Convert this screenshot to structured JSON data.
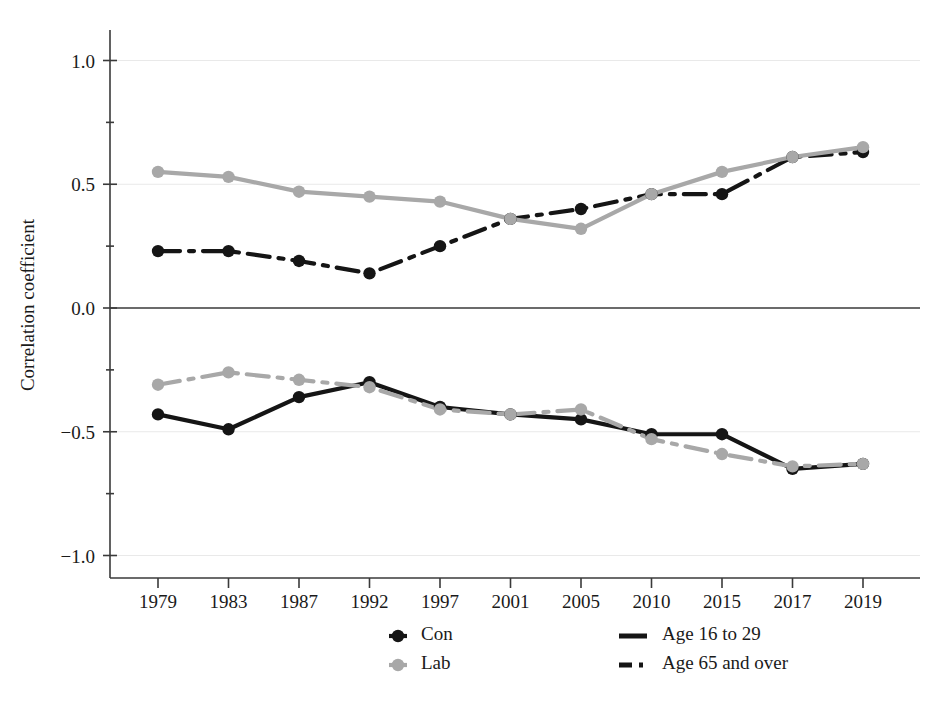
{
  "chart_data": {
    "type": "line",
    "title": "",
    "subtitle": "",
    "xlabel": "",
    "ylabel": "Correlation coefficient",
    "categories": [
      "1979",
      "1983",
      "1987",
      "1992",
      "1997",
      "2001",
      "2005",
      "2010",
      "2015",
      "2017",
      "2019"
    ],
    "x": [
      1979,
      1983,
      1987,
      1992,
      1997,
      2001,
      2005,
      2010,
      2015,
      2017,
      2019
    ],
    "ylim": [
      -1.15,
      1.15
    ],
    "yticks": [
      1.0,
      0.5,
      0.0,
      -0.5,
      -1.0
    ],
    "ytick_labels": [
      "1.0",
      "0.5",
      "0.0",
      "-0.5",
      "-1.0"
    ],
    "grid": true,
    "grid_axis": "y",
    "legend_position": "bottom",
    "zero_line": true,
    "series": [
      {
        "name": "Con, Age 65 and over",
        "party": "Con",
        "age_group": "Age 65 and over",
        "color": "#151515",
        "dash": "dash-dot",
        "marker": "circle",
        "values": [
          0.23,
          0.23,
          0.19,
          0.14,
          0.25,
          0.36,
          0.4,
          0.46,
          0.46,
          0.61,
          0.63
        ]
      },
      {
        "name": "Lab, Age 16 to 29",
        "party": "Lab",
        "age_group": "Age 16 to 29",
        "color": "#a8a8a8",
        "dash": "solid",
        "marker": "circle",
        "values": [
          0.55,
          0.53,
          0.47,
          0.45,
          0.43,
          0.36,
          0.32,
          0.46,
          0.55,
          0.61,
          0.65
        ]
      },
      {
        "name": "Con, Age 16 to 29",
        "party": "Con",
        "age_group": "Age 16 to 29",
        "color": "#151515",
        "dash": "solid",
        "marker": "circle",
        "values": [
          -0.43,
          -0.49,
          -0.36,
          -0.3,
          -0.4,
          -0.43,
          -0.45,
          -0.51,
          -0.51,
          -0.65,
          -0.63
        ]
      },
      {
        "name": "Lab, Age 65 and over",
        "party": "Lab",
        "age_group": "Age 65 and over",
        "color": "#a8a8a8",
        "dash": "dash-dot",
        "marker": "circle",
        "values": [
          -0.31,
          -0.26,
          -0.29,
          -0.32,
          -0.41,
          -0.43,
          -0.41,
          -0.53,
          -0.59,
          -0.64,
          -0.63
        ]
      }
    ]
  },
  "axes": {
    "ylabel": "Correlation coefficient",
    "ytick_labels": [
      "1.0",
      "0.5",
      "0.0",
      "-0.5",
      "-1.0"
    ],
    "xtick_labels": [
      "1979",
      "1983",
      "1987",
      "1992",
      "1997",
      "2001",
      "2005",
      "2010",
      "2015",
      "2017",
      "2019"
    ]
  },
  "legend": {
    "party_entries": [
      {
        "label": "Con",
        "color": "#151515",
        "marker": "circle"
      },
      {
        "label": "Lab",
        "color": "#a8a8a8",
        "marker": "circle"
      }
    ],
    "age_entries": [
      {
        "label": "Age 16 to 29",
        "color": "#151515",
        "dash": "solid"
      },
      {
        "label": "Age 65 and over",
        "color": "#151515",
        "dash": "dash-dot"
      }
    ]
  },
  "colors": {
    "con": "#151515",
    "lab": "#a8a8a8",
    "axis": "#3a3a3a",
    "grid": "#e9e9e9",
    "background": "#ffffff"
  }
}
